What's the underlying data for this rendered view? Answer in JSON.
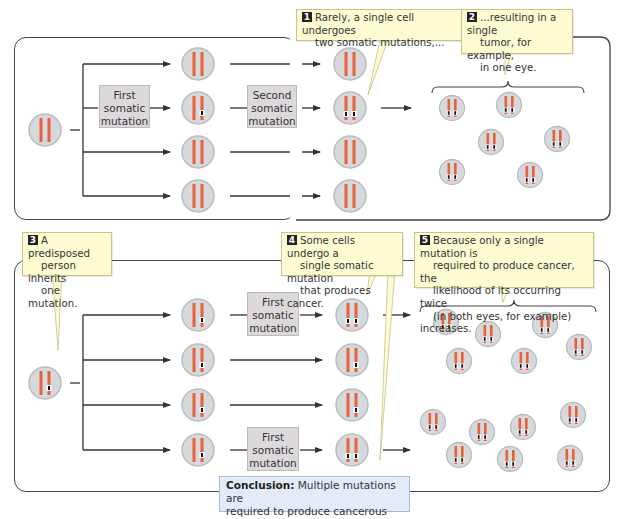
{
  "figure": {
    "top_panel": {
      "callouts": [
        {
          "number": "1",
          "text_line1": "Rarely, a single cell undergoes",
          "text_line2": "two somatic mutations,..."
        },
        {
          "number": "2",
          "text_line1": "...resulting in a single",
          "text_line2": "tumor, for example,",
          "text_line3": "in one eye."
        }
      ],
      "mutation_boxes": [
        {
          "line1": "First",
          "line2": "somatic",
          "line3": "mutation"
        },
        {
          "line1": "Second",
          "line2": "somatic",
          "line3": "mutation"
        }
      ],
      "parent_cell": {
        "mutations": 0
      },
      "first_generation": [
        {
          "row": 1,
          "mutations": 0
        },
        {
          "row": 2,
          "mutations": 1
        },
        {
          "row": 3,
          "mutations": 0
        },
        {
          "row": 4,
          "mutations": 0
        }
      ],
      "second_generation": [
        {
          "row": 1,
          "mutations": 0
        },
        {
          "row": 2,
          "mutations": 2
        },
        {
          "row": 3,
          "mutations": 0
        },
        {
          "row": 4,
          "mutations": 0
        }
      ],
      "tumor_cells_count": 6
    },
    "bottom_panel": {
      "callouts": [
        {
          "number": "3",
          "text_line1": "A predisposed",
          "text_line2": "person inherits",
          "text_line3": "one mutation."
        },
        {
          "number": "4",
          "text_line1": "Some cells undergo a",
          "text_line2": "single somatic mutation",
          "text_line3": "that produces cancer."
        },
        {
          "number": "5",
          "text_line1": "Because only a single mutation is",
          "text_line2": "required to produce cancer, the",
          "text_line3": "likelihood of its occurring twice",
          "text_line4": "(in both eyes, for example) increases."
        }
      ],
      "mutation_boxes": [
        {
          "line1": "First",
          "line2": "somatic",
          "line3": "mutation"
        },
        {
          "line1": "First",
          "line2": "somatic",
          "line3": "mutation"
        }
      ],
      "parent_cell": {
        "mutations": 1
      },
      "first_generation": [
        {
          "row": 1,
          "mutations": 1
        },
        {
          "row": 2,
          "mutations": 1
        },
        {
          "row": 3,
          "mutations": 1
        },
        {
          "row": 4,
          "mutations": 1
        }
      ],
      "second_generation": [
        {
          "row": 1,
          "mutations": 2
        },
        {
          "row": 2,
          "mutations": 1
        },
        {
          "row": 3,
          "mutations": 1
        },
        {
          "row": 4,
          "mutations": 2
        }
      ],
      "tumor_cells_top_count": 7,
      "tumor_cells_bottom_count": 8
    },
    "conclusion": {
      "label": "Conclusion:",
      "text_line1": " Multiple mutations are",
      "text_line2": "required to produce cancerous cells."
    },
    "colors": {
      "chromosome": "#e8613d",
      "cell_fill": "#d6d9db",
      "cell_border": "#b9bcbe",
      "callout_fill": "#fdfbd2",
      "mutation_box_fill": "#dcd8dc",
      "conclusion_fill": "#e3ebf8"
    }
  }
}
